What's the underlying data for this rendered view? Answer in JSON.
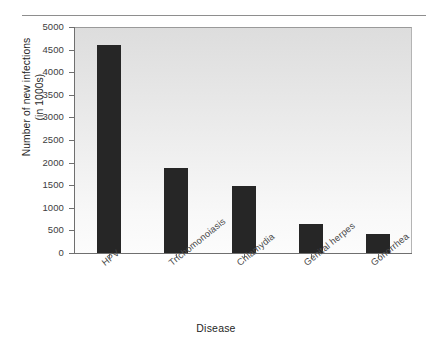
{
  "chart_data": {
    "type": "bar",
    "title": "",
    "xlabel": "Disease",
    "ylabel_line1": "Number of new infections",
    "ylabel_line2": "(in 1000s)",
    "categories": [
      "HPV",
      "Trichomonoiasis",
      "Chlamydia",
      "Genital herpes",
      "Gonorrhea"
    ],
    "values": [
      4600,
      1880,
      1490,
      640,
      430
    ],
    "ylim": [
      0,
      5000
    ],
    "ytick_labels": [
      "5000",
      "4500",
      "4000",
      "3500",
      "3000",
      "2500",
      "2000",
      "1500",
      "1000",
      "500",
      "0"
    ],
    "ytick_values": [
      5000,
      4500,
      4000,
      3500,
      3000,
      2500,
      2000,
      1500,
      1000,
      500,
      0
    ],
    "grid": false,
    "legend": "none",
    "bar_color": "#262626",
    "axis_color": "#6f6f6f",
    "plot_background_top": "#dddddd",
    "plot_background_bottom": "#fcfcfc"
  }
}
